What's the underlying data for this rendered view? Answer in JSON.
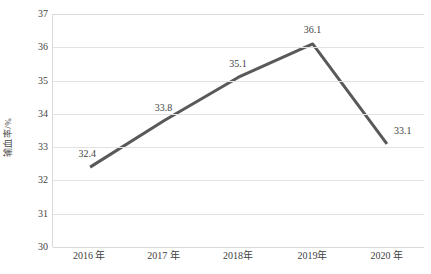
{
  "chart_data": {
    "type": "line",
    "title": "",
    "subtitle": "",
    "xlabel": "",
    "ylabel": "输血率/%",
    "categories": [
      "2016 年",
      "2017 年",
      "2018年",
      "2019年",
      "2020 年"
    ],
    "values": [
      32.4,
      33.8,
      35.1,
      36.1,
      33.1
    ],
    "data_labels": [
      "32.4",
      "33.8",
      "35.1",
      "36.1",
      "33.1"
    ],
    "series": [
      {
        "name": "输血率",
        "values": [
          32.4,
          33.8,
          35.1,
          36.1,
          33.1
        ]
      }
    ],
    "ylim": [
      30,
      37
    ],
    "y_ticks": [
      37,
      36,
      35,
      34,
      33,
      32,
      31,
      30
    ],
    "y_tick_labels": [
      "37",
      "36",
      "35",
      "34",
      "33",
      "32",
      "31",
      "30"
    ],
    "grid": true,
    "grid_axis": "y",
    "legend": false,
    "legend_position": "none",
    "markers": false,
    "line_color": "#595959",
    "grid_color": "#e2e2e2",
    "axis_color": "#d9d9d9",
    "text_color": "#3f3f3f",
    "background_color": "#ffffff"
  }
}
